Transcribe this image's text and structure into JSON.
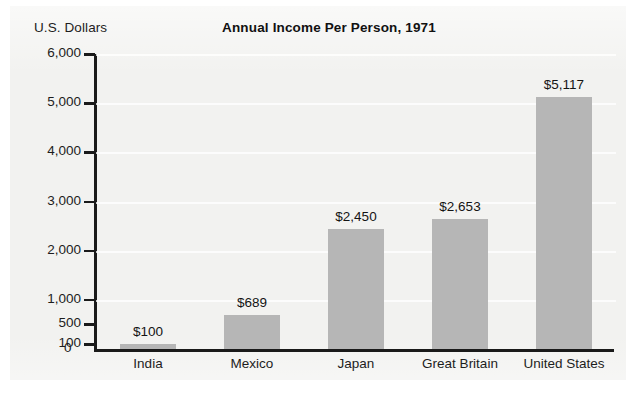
{
  "chart_data": {
    "type": "bar",
    "title": "Annual Income Per Person, 1971",
    "ylabel": "U.S. Dollars",
    "xlabel": "",
    "categories": [
      "India",
      "Mexico",
      "Japan",
      "Great Britain",
      "United States"
    ],
    "values": [
      100,
      689,
      2450,
      2653,
      5117
    ],
    "value_labels": [
      "$100",
      "$689",
      "$2,450",
      "$2,653",
      "$5,117"
    ],
    "ylim": [
      0,
      6000
    ],
    "ytick_values": [
      0,
      100,
      500,
      1000,
      2000,
      3000,
      4000,
      5000,
      6000
    ],
    "ytick_labels": [
      "0",
      "100",
      "500",
      "1,000",
      "2,000",
      "3,000",
      "4,000",
      "5,000",
      "6,000"
    ],
    "gridlines": true,
    "grid_values": [
      1000,
      2000,
      3000,
      4000,
      5000,
      6000
    ],
    "legend": null,
    "bar_color": "#b6b6b6",
    "background_color": "#f2f2f0",
    "axis_color": "#1a1a1a",
    "text_color": "#1d1d1d"
  },
  "zero_tick_label": "0"
}
